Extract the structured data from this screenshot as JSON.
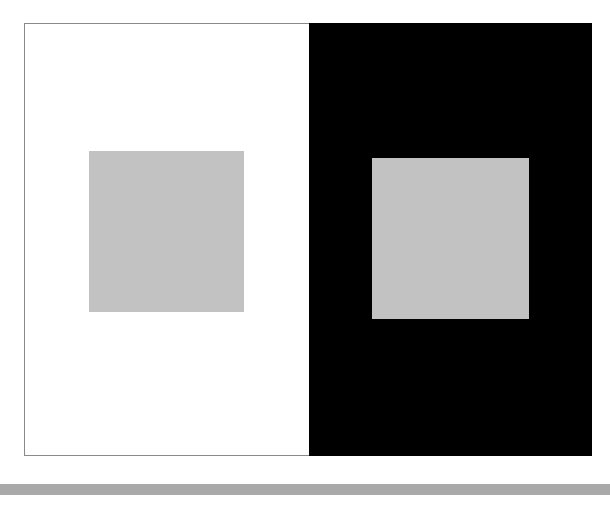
{
  "figure": {
    "left_panel": {
      "background": "#ffffff",
      "square_color": "#c2c2c2"
    },
    "right_panel": {
      "background": "#000000",
      "square_color": "#c2c2c2"
    },
    "bottom_rule_color": "#a9a9a9"
  }
}
